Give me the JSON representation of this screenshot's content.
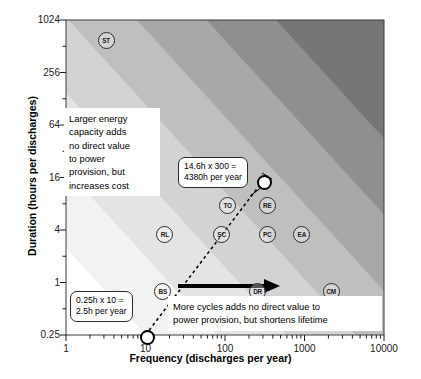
{
  "chart_data": {
    "type": "scatter",
    "title": "",
    "xlabel": "Frequency (discharges per year)",
    "ylabel": "Duration (hours per discharges)",
    "xscale": "log",
    "yscale": "log",
    "xlim": [
      1,
      10000
    ],
    "ylim": [
      0.25,
      1024
    ],
    "xticks": [
      "1",
      "10",
      "100",
      "1000",
      "10000"
    ],
    "xtick_values": [
      1,
      10,
      100,
      1000,
      10000
    ],
    "yticks": [
      "0.25",
      "1",
      "4",
      "16",
      "64",
      "256",
      "1024"
    ],
    "ytick_values": [
      0.25,
      1,
      4,
      16,
      64,
      256,
      1024
    ],
    "grid": false,
    "legend": "none",
    "shading_note": "Greyscale bands of constant annual energy throughput (duration x frequency); darker shading indicates higher hours per year, white region at lower right is unattainable",
    "points": [
      {
        "label": "ST",
        "x": 3.1,
        "y": 620
      },
      {
        "label": "RL",
        "x": 17,
        "y": 3.6
      },
      {
        "label": "BS",
        "x": 16,
        "y": 0.82
      },
      {
        "label": "TO",
        "x": 105,
        "y": 7.8
      },
      {
        "label": "SC",
        "x": 88,
        "y": 3.6
      },
      {
        "label": "RE",
        "x": 330,
        "y": 7.8
      },
      {
        "label": "PC",
        "x": 330,
        "y": 3.6
      },
      {
        "label": "EA",
        "x": 900,
        "y": 3.6
      },
      {
        "label": "DR",
        "x": 250,
        "y": 0.82
      },
      {
        "label": "CM",
        "x": 2100,
        "y": 0.82
      },
      {
        "label": "HC",
        "x": 5200,
        "y": 0.44
      }
    ],
    "highlighted": [
      {
        "label": "low-throughput-endpoint",
        "x": 10,
        "y": 0.25
      },
      {
        "label": "high-throughput-endpoint",
        "x": 300,
        "y": 14.6
      }
    ],
    "connector": {
      "from": [
        10,
        0.25
      ],
      "to": [
        300,
        14.6
      ],
      "style": "dashed"
    }
  },
  "annotations": {
    "callout_high": "14.6h x 300 =\n4380h per year",
    "callout_low": "0.25h x 10 =\n2.5h per year",
    "note_vertical": "Larger energy\ncapacity adds\nno direct value\nto power\nprovision, but\nincreases cost",
    "note_horizontal": "More cycles adds no direct value to\npower provision, but shortens lifetime"
  },
  "arrows": {
    "vertical_arrow": "up-arrow",
    "horizontal_arrow": "right-arrow"
  },
  "colors": {
    "axis": "#1a1a1a",
    "band_1": "#f2f2f2",
    "band_2": "#e4e4e4",
    "band_3": "#d3d3d3",
    "band_4": "#bfbfbf",
    "band_5": "#a8a8a8",
    "band_6": "#8f8f8f",
    "band_7": "#767676",
    "marker_outline": "#2b2b2b"
  }
}
